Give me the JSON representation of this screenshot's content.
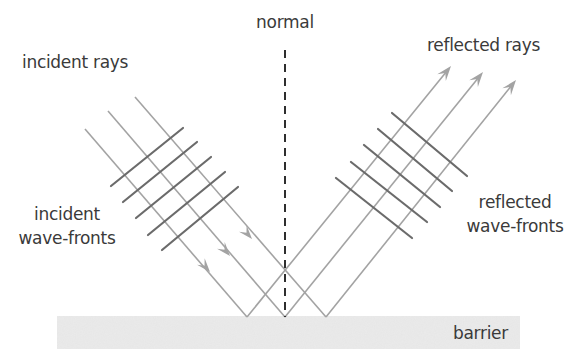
{
  "diagram": {
    "labels": {
      "normal": "normal",
      "incident_rays": "incident rays",
      "reflected_rays": "reflected rays",
      "incident_wavefronts_line1": "incident",
      "incident_wavefronts_line2": "wave-fronts",
      "reflected_wavefronts_line1": "reflected",
      "reflected_wavefronts_line2": "wave-fronts",
      "barrier": "barrier"
    },
    "colors": {
      "ray": "#a3a3a3",
      "wavefront": "#6b6b6b",
      "normal": "#2e2e2e",
      "barrier": "#e6e6e6",
      "text": "#3a3a3a"
    },
    "barrier": {
      "x": 57,
      "y": 316,
      "width": 463,
      "height": 33
    },
    "normal": {
      "x": 285,
      "y1": 50,
      "y2": 317
    },
    "incident_rays": [
      {
        "x1": 85,
        "y1": 129,
        "x2": 247,
        "y2": 317,
        "arrow": [
          210,
          272
        ]
      },
      {
        "x1": 108,
        "y1": 111,
        "x2": 285,
        "y2": 317,
        "arrow": [
          230,
          256
        ]
      },
      {
        "x1": 135,
        "y1": 97,
        "x2": 326,
        "y2": 317,
        "arrow": [
          252,
          239
        ]
      }
    ],
    "reflected_rays": [
      {
        "x1": 247,
        "y1": 317,
        "x2": 451,
        "y2": 66
      },
      {
        "x1": 285,
        "y1": 317,
        "x2": 483,
        "y2": 72
      },
      {
        "x1": 326,
        "y1": 317,
        "x2": 516,
        "y2": 80
      }
    ],
    "incident_wavefronts": [
      {
        "x1": 111,
        "y1": 186,
        "x2": 183,
        "y2": 128
      },
      {
        "x1": 123,
        "y1": 202,
        "x2": 197,
        "y2": 142
      },
      {
        "x1": 136,
        "y1": 218,
        "x2": 211,
        "y2": 157
      },
      {
        "x1": 148,
        "y1": 235,
        "x2": 225,
        "y2": 172
      },
      {
        "x1": 162,
        "y1": 250,
        "x2": 238,
        "y2": 187
      }
    ],
    "reflected_wavefronts": [
      {
        "x1": 392,
        "y1": 113,
        "x2": 467,
        "y2": 176
      },
      {
        "x1": 378,
        "y1": 129,
        "x2": 452,
        "y2": 191
      },
      {
        "x1": 364,
        "y1": 145,
        "x2": 440,
        "y2": 207
      },
      {
        "x1": 351,
        "y1": 162,
        "x2": 427,
        "y2": 222
      },
      {
        "x1": 336,
        "y1": 178,
        "x2": 412,
        "y2": 238
      }
    ]
  }
}
